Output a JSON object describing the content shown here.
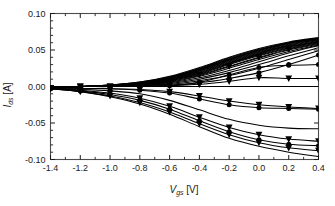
{
  "chart_data": {
    "type": "line",
    "title": "",
    "subtitle": "",
    "xlabel": "V_gs [V]",
    "xlabel_symbol": "V",
    "xlabel_sub": "gs",
    "xlabel_unit": "[V]",
    "ylabel": "I_ds [A]",
    "ylabel_symbol": "I",
    "ylabel_sub": "ds",
    "ylabel_unit": "[A]",
    "xlim": [
      -1.4,
      0.4
    ],
    "ylim": [
      -0.1,
      0.1
    ],
    "xticks": [
      -1.4,
      -1.2,
      -1.0,
      -0.8,
      -0.6,
      -0.4,
      -0.2,
      0.0,
      0.2,
      0.4
    ],
    "xticklabels": [
      "-1.4",
      "-1.2",
      "-1.0",
      "-0.8",
      "-0.6",
      "-0.4",
      "-0.2",
      "0.0",
      "0.2",
      "0.4"
    ],
    "yticks": [
      0.1,
      0.05,
      0.0,
      -0.05,
      -0.1
    ],
    "yticklabels": [
      "0.10",
      "0.05",
      "0.00",
      "-0.05",
      "-0.10"
    ],
    "x_minor_count": 1,
    "y_minor_count": 4,
    "grid": false,
    "legend": "none",
    "zero_line": true,
    "line_color": "#000000",
    "marker_colors": {
      "triangle": "#000000",
      "circle": "#000000"
    },
    "x": [
      -1.4,
      -1.2,
      -1.0,
      -0.8,
      -0.6,
      -0.4,
      -0.2,
      0.0,
      0.2,
      0.4
    ],
    "series": [
      {
        "name": "upper-bundle-01",
        "marker": "none",
        "values": [
          -0.002,
          0.0,
          0.002,
          0.006,
          0.014,
          0.026,
          0.04,
          0.052,
          0.061,
          0.067
        ]
      },
      {
        "name": "upper-bundle-02",
        "marker": "none",
        "values": [
          -0.002,
          0.0,
          0.002,
          0.006,
          0.013,
          0.025,
          0.039,
          0.051,
          0.06,
          0.066
        ]
      },
      {
        "name": "upper-bundle-03",
        "marker": "none",
        "values": [
          -0.002,
          0.0,
          0.002,
          0.005,
          0.013,
          0.024,
          0.038,
          0.05,
          0.06,
          0.066
        ]
      },
      {
        "name": "upper-bundle-04",
        "marker": "none",
        "values": [
          -0.002,
          0.0,
          0.002,
          0.005,
          0.012,
          0.024,
          0.037,
          0.05,
          0.059,
          0.065
        ]
      },
      {
        "name": "upper-bundle-05",
        "marker": "none",
        "values": [
          -0.002,
          0.0,
          0.001,
          0.005,
          0.012,
          0.023,
          0.037,
          0.049,
          0.059,
          0.065
        ]
      },
      {
        "name": "upper-bundle-06",
        "marker": "none",
        "values": [
          -0.002,
          0.0,
          0.001,
          0.004,
          0.011,
          0.022,
          0.036,
          0.048,
          0.058,
          0.064
        ]
      },
      {
        "name": "upper-bundle-07",
        "marker": "none",
        "values": [
          -0.002,
          0.0,
          0.001,
          0.004,
          0.011,
          0.022,
          0.035,
          0.047,
          0.057,
          0.064
        ]
      },
      {
        "name": "upper-bundle-08",
        "marker": "none",
        "values": [
          -0.002,
          0.0,
          0.001,
          0.004,
          0.01,
          0.021,
          0.034,
          0.046,
          0.056,
          0.063
        ]
      },
      {
        "name": "upper-bundle-09",
        "marker": "none",
        "values": [
          -0.002,
          0.0,
          0.001,
          0.003,
          0.01,
          0.02,
          0.033,
          0.045,
          0.055,
          0.062
        ]
      },
      {
        "name": "upper-bundle-10",
        "marker": "none",
        "values": [
          -0.002,
          0.0,
          0.001,
          0.003,
          0.009,
          0.019,
          0.032,
          0.044,
          0.054,
          0.061
        ]
      },
      {
        "name": "upper-bundle-11",
        "marker": "none",
        "values": [
          -0.002,
          0.0,
          0.0,
          0.003,
          0.009,
          0.018,
          0.031,
          0.043,
          0.053,
          0.061
        ]
      },
      {
        "name": "upper-bundle-12",
        "marker": "none",
        "values": [
          -0.002,
          0.0,
          0.0,
          0.002,
          0.008,
          0.017,
          0.03,
          0.042,
          0.052,
          0.06
        ]
      },
      {
        "name": "upper-bundle-13",
        "marker": "triangle-down",
        "values": [
          -0.002,
          0.0,
          0.0,
          0.002,
          0.008,
          0.016,
          0.028,
          0.04,
          0.051,
          0.059
        ]
      },
      {
        "name": "upper-bundle-14",
        "marker": "none",
        "values": [
          -0.002,
          0.0,
          0.0,
          0.002,
          0.007,
          0.015,
          0.027,
          0.039,
          0.05,
          0.058
        ]
      },
      {
        "name": "upper-bundle-15",
        "marker": "none",
        "values": [
          -0.002,
          0.0,
          0.0,
          0.002,
          0.006,
          0.014,
          0.025,
          0.037,
          0.048,
          0.057
        ]
      },
      {
        "name": "upper-spread-16",
        "marker": "none",
        "values": [
          -0.002,
          0.0,
          0.0,
          0.001,
          0.005,
          0.012,
          0.022,
          0.034,
          0.046,
          0.056
        ]
      },
      {
        "name": "upper-spread-17",
        "marker": "none",
        "values": [
          -0.002,
          0.0,
          0.0,
          0.001,
          0.004,
          0.01,
          0.019,
          0.03,
          0.042,
          0.053
        ]
      },
      {
        "name": "upper-spread-18",
        "marker": "none",
        "values": [
          -0.002,
          0.0,
          0.0,
          0.001,
          0.003,
          0.008,
          0.015,
          0.025,
          0.037,
          0.049
        ]
      },
      {
        "name": "upper-spread-19",
        "marker": "circle",
        "values": [
          -0.002,
          0.0,
          0.0,
          0.0,
          0.002,
          0.005,
          0.011,
          0.019,
          0.03,
          0.043
        ]
      },
      {
        "name": "upper-flat-20",
        "marker": "triangle-down",
        "values": [
          -0.002,
          0.0,
          0.0,
          0.0,
          0.001,
          0.003,
          0.007,
          0.012,
          0.011,
          0.011
        ]
      },
      {
        "name": "upper-flat-21",
        "marker": "circle",
        "values": [
          -0.002,
          0.0,
          0.0,
          0.0,
          0.001,
          0.006,
          0.016,
          0.026,
          0.029,
          0.03
        ]
      },
      {
        "name": "lower-01",
        "marker": "triangle-down",
        "values": [
          -0.003,
          -0.003,
          -0.003,
          -0.004,
          -0.007,
          -0.013,
          -0.02,
          -0.025,
          -0.028,
          -0.03
        ]
      },
      {
        "name": "lower-02",
        "marker": "circle",
        "values": [
          -0.003,
          -0.003,
          -0.003,
          -0.005,
          -0.009,
          -0.017,
          -0.025,
          -0.029,
          -0.03,
          -0.031
        ]
      },
      {
        "name": "lower-03",
        "marker": "none",
        "values": [
          -0.003,
          -0.004,
          -0.006,
          -0.01,
          -0.019,
          -0.032,
          -0.045,
          -0.053,
          -0.057,
          -0.058
        ]
      },
      {
        "name": "lower-04",
        "marker": "triangle-down",
        "values": [
          -0.003,
          -0.005,
          -0.009,
          -0.016,
          -0.027,
          -0.042,
          -0.056,
          -0.066,
          -0.072,
          -0.075
        ]
      },
      {
        "name": "lower-05",
        "marker": "circle",
        "values": [
          -0.003,
          -0.006,
          -0.011,
          -0.019,
          -0.031,
          -0.047,
          -0.062,
          -0.073,
          -0.079,
          -0.081
        ]
      },
      {
        "name": "lower-06",
        "marker": "triangle-down",
        "values": [
          -0.003,
          -0.007,
          -0.013,
          -0.022,
          -0.035,
          -0.051,
          -0.066,
          -0.077,
          -0.084,
          -0.088
        ]
      },
      {
        "name": "lower-07",
        "marker": "none",
        "values": [
          -0.003,
          -0.007,
          -0.014,
          -0.024,
          -0.038,
          -0.055,
          -0.071,
          -0.082,
          -0.09,
          -0.096
        ]
      }
    ]
  }
}
